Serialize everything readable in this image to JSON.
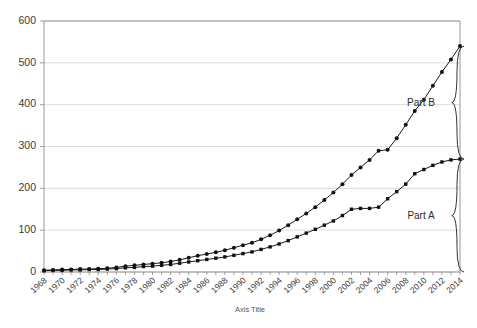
{
  "chart_data": {
    "type": "line",
    "title": "",
    "xlabel": "Axis Title",
    "ylabel": "",
    "ylim": [
      0,
      600
    ],
    "yticks": [
      0,
      100,
      200,
      300,
      400,
      500,
      600
    ],
    "ytick_labels": [
      "0",
      "100",
      "200",
      "300",
      "400",
      "500",
      "600"
    ],
    "grid": true,
    "legend": "none",
    "x": [
      1968,
      1969,
      1970,
      1971,
      1972,
      1973,
      1974,
      1975,
      1976,
      1977,
      1978,
      1979,
      1980,
      1981,
      1982,
      1983,
      1984,
      1985,
      1986,
      1987,
      1988,
      1989,
      1990,
      1991,
      1992,
      1993,
      1994,
      1995,
      1996,
      1997,
      1998,
      1999,
      2000,
      2001,
      2002,
      2003,
      2004,
      2005,
      2006,
      2007,
      2008,
      2009,
      2010,
      2011,
      2012,
      2013,
      2014
    ],
    "xtick_labels": [
      "1968",
      "1970",
      "1972",
      "1974",
      "1976",
      "1978",
      "1980",
      "1982",
      "1984",
      "1986",
      "1988",
      "1990",
      "1992",
      "1994",
      "1996",
      "1998",
      "2000",
      "2002",
      "2004",
      "2006",
      "2008",
      "2010",
      "2012",
      "2014"
    ],
    "xtick_values": [
      1968,
      1970,
      1972,
      1974,
      1976,
      1978,
      1980,
      1982,
      1984,
      1986,
      1988,
      1990,
      1992,
      1994,
      1996,
      1998,
      2000,
      2002,
      2004,
      2006,
      2008,
      2010,
      2012,
      2014
    ],
    "series": [
      {
        "name": "Total",
        "values": [
          4,
          5,
          6,
          6,
          7,
          7,
          8,
          9,
          11,
          14,
          16,
          18,
          20,
          22,
          25,
          29,
          34,
          39,
          43,
          47,
          52,
          58,
          64,
          70,
          78,
          88,
          99,
          112,
          126,
          140,
          155,
          172,
          190,
          210,
          232,
          250,
          268,
          290,
          292,
          320,
          352,
          385,
          412,
          445,
          478,
          508,
          540
        ]
      },
      {
        "name": "Part A",
        "values": [
          3,
          4,
          4,
          5,
          5,
          6,
          6,
          7,
          8,
          10,
          11,
          13,
          14,
          16,
          18,
          21,
          24,
          27,
          30,
          33,
          36,
          40,
          44,
          48,
          54,
          60,
          67,
          75,
          84,
          93,
          102,
          112,
          122,
          135,
          150,
          152,
          152,
          155,
          175,
          192,
          210,
          235,
          245,
          255,
          263,
          268,
          270
        ]
      }
    ],
    "annotations": [
      {
        "label": "Part B",
        "from_value": 270,
        "to_value": 540
      },
      {
        "label": "Part A",
        "from_value": 0,
        "to_value": 270
      }
    ]
  }
}
